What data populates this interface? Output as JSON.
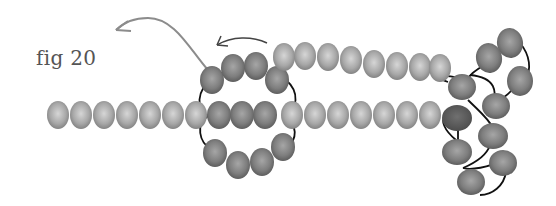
{
  "figure": {
    "label": "fig 20",
    "colors": {
      "bead_light": "#b4b4b4",
      "bead_mid": "#8a8a8a",
      "bead_dark": "#5a5a5a",
      "thread": "#111111",
      "arrow_grey": "#8c8c8c",
      "arrow_dark": "#333333"
    },
    "arrows": [
      {
        "name": "large-grey-arrow",
        "direction": "left-up"
      },
      {
        "name": "small-dark-arrow",
        "direction": "left"
      }
    ],
    "strands": {
      "left_strand_beads": 7,
      "middle_row_beads": 11,
      "top_row_beads": 11,
      "bottom_loop_beads": 4,
      "right_cluster_beads": 10
    }
  }
}
